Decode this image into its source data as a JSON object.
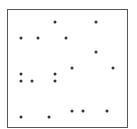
{
  "diagram": {
    "type": "dot-grid",
    "frame": {
      "left": 7,
      "top": 9,
      "right": 127,
      "bottom": 127,
      "color": "#555555"
    },
    "dot_color": "#333333",
    "dots": [
      {
        "x": 55,
        "y": 22
      },
      {
        "x": 96,
        "y": 22
      },
      {
        "x": 21,
        "y": 38
      },
      {
        "x": 38,
        "y": 38
      },
      {
        "x": 66,
        "y": 38
      },
      {
        "x": 96,
        "y": 52
      },
      {
        "x": 72,
        "y": 68
      },
      {
        "x": 113,
        "y": 68
      },
      {
        "x": 21,
        "y": 74
      },
      {
        "x": 55,
        "y": 74
      },
      {
        "x": 21,
        "y": 81
      },
      {
        "x": 32,
        "y": 81
      },
      {
        "x": 55,
        "y": 81
      },
      {
        "x": 72,
        "y": 111
      },
      {
        "x": 83,
        "y": 111
      },
      {
        "x": 107,
        "y": 111
      },
      {
        "x": 21,
        "y": 117
      },
      {
        "x": 49,
        "y": 117
      }
    ]
  }
}
